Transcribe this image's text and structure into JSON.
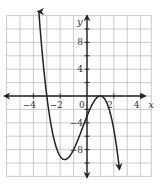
{
  "chart_data": {
    "type": "line",
    "title": "",
    "xlabel": "x",
    "ylabel": "y",
    "function": "f(x) = -(x+3)(x-1)^2",
    "xlim": [
      -6,
      4.8
    ],
    "ylim": [
      -12,
      12
    ],
    "x_grid_step": 1,
    "y_grid_step": 2,
    "grid": true,
    "x_ticks": [
      -4,
      -2,
      0,
      2,
      4
    ],
    "x_tick_labels": [
      "−4",
      "−2",
      "0",
      "2",
      "4"
    ],
    "y_ticks": [
      8,
      4,
      -4,
      -8
    ],
    "y_tick_labels": [
      "8",
      "4",
      "−4",
      "−8"
    ],
    "key_points": [
      {
        "label": "x-intercept",
        "x": -3,
        "y": 0
      },
      {
        "label": "local minimum",
        "x": -1.67,
        "y": -9.48
      },
      {
        "label": "y-intercept",
        "x": 0,
        "y": -3
      },
      {
        "label": "double root / local maximum",
        "x": 1,
        "y": 0
      }
    ],
    "series": [
      {
        "name": "f(x)",
        "x": [
          -3.65,
          -3.5,
          -3.25,
          -3.0,
          -2.75,
          -2.5,
          -2.25,
          -2.0,
          -1.75,
          -1.5,
          -1.25,
          -1.0,
          -0.75,
          -0.5,
          -0.25,
          0.0,
          0.25,
          0.5,
          0.75,
          1.0,
          1.25,
          1.5,
          1.75,
          2.0,
          2.25,
          2.42
        ],
        "values": [
          13.6,
          10.1,
          4.8,
          0.0,
          -3.5,
          -6.1,
          -8.1,
          -9.0,
          -9.5,
          -9.4,
          -8.9,
          -8.0,
          -6.8,
          -5.6,
          -4.2,
          -3.0,
          -1.8,
          -0.9,
          -0.2,
          0.0,
          -0.3,
          -1.1,
          -2.7,
          -5.0,
          -8.2,
          -10.9
        ]
      }
    ],
    "arrows": [
      "top-left end",
      "bottom-right end",
      "x-axis both ends",
      "y-axis both ends"
    ]
  }
}
